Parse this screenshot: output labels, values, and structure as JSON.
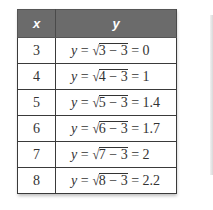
{
  "table": {
    "headers": {
      "x": "x",
      "y": "y"
    },
    "header_bg": "#6b6b6b",
    "rows": [
      {
        "x": "3",
        "y_var": "y",
        "eq": " = ",
        "radicand": "3 − 3",
        "result": " = 0"
      },
      {
        "x": "4",
        "y_var": "y",
        "eq": " = ",
        "radicand": "4 − 3",
        "result": " = 1"
      },
      {
        "x": "5",
        "y_var": "y",
        "eq": " = ",
        "radicand": "5 − 3",
        "result": " = 1.4"
      },
      {
        "x": "6",
        "y_var": "y",
        "eq": " = ",
        "radicand": "6 − 3",
        "result": " = 1.7"
      },
      {
        "x": "7",
        "y_var": "y",
        "eq": " = ",
        "radicand": "7 − 3",
        "result": " = 2"
      },
      {
        "x": "8",
        "y_var": "y",
        "eq": " = ",
        "radicand": "8 − 3",
        "result": " = 2.2"
      }
    ],
    "radical_symbol": "√"
  }
}
